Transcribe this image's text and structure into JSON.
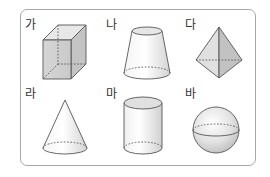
{
  "figure": {
    "type": "solid-figures-set",
    "border_color": "#a8a8a8",
    "items": [
      {
        "label": "가",
        "shape": "rectangular-prism"
      },
      {
        "label": "나",
        "shape": "truncated-cone"
      },
      {
        "label": "다",
        "shape": "triangular-bipyramid"
      },
      {
        "label": "라",
        "shape": "cone"
      },
      {
        "label": "마",
        "shape": "cylinder"
      },
      {
        "label": "바",
        "shape": "sphere"
      }
    ]
  }
}
